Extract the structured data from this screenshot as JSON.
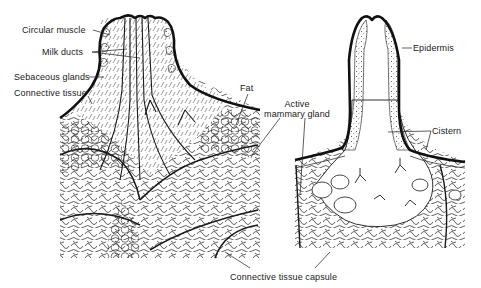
{
  "figure": {
    "left_panel": {
      "name": "Nipple and mammary gland (non-cistern type) cross-section",
      "labels": [
        {
          "id": "circular-muscle",
          "text": "Circular muscle"
        },
        {
          "id": "milk-ducts",
          "text": "Milk ducts"
        },
        {
          "id": "sebaceous-glands",
          "text": "Sebaceous glands"
        },
        {
          "id": "connective-tissue",
          "text": "Connective tissue"
        },
        {
          "id": "fat",
          "text": "Fat"
        }
      ]
    },
    "shared_labels": {
      "active_mammary_gland_line1": "Active",
      "active_mammary_gland_line2": "mammary gland",
      "connective_tissue_capsule": "Connective tissue capsule"
    },
    "right_panel": {
      "name": "Teat with cistern cross-section",
      "labels": [
        {
          "id": "epidermis",
          "text": "Epidermis"
        },
        {
          "id": "cistern",
          "text": "Cistern"
        }
      ]
    },
    "colors": {
      "ink": "#1a1a1a",
      "background": "#ffffff"
    }
  }
}
